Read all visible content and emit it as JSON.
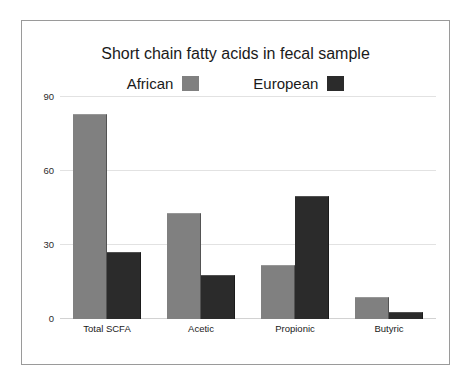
{
  "figure": {
    "border_color": "#9a9a9a",
    "background": "#ffffff"
  },
  "chart_data": {
    "type": "bar",
    "title": "Short chain fatty acids in fecal sample",
    "xlabel": "",
    "ylabel": "",
    "categories": [
      "Total SCFA",
      "Acetic",
      "Propionic",
      "Butyric"
    ],
    "series": [
      {
        "name": "African",
        "color": "#808080",
        "values": [
          83,
          43,
          22,
          9
        ]
      },
      {
        "name": "European",
        "color": "#2b2b2b",
        "values": [
          27,
          18,
          50,
          3
        ]
      }
    ],
    "ylim": [
      0,
      90
    ],
    "yticks": [
      0,
      30,
      60,
      90
    ],
    "ytick_labels": [
      "0",
      "30",
      "60",
      "90"
    ],
    "grid": true,
    "grid_color": "#e2e2e2",
    "legend_position": "top-center",
    "legend": [
      {
        "label": "African",
        "swatch": "#808080"
      },
      {
        "label": "European",
        "swatch": "#2b2b2b"
      }
    ]
  }
}
